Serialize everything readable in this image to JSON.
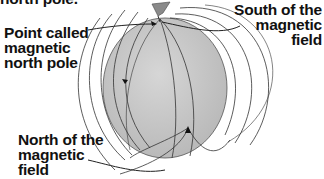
{
  "diagram": {
    "title_fragment": "north pole.",
    "labels": {
      "point_called": "Point called\nmagnetic\nnorth pole",
      "south_field": "South of the\nmagnetic\nfield",
      "north_field": "North of the\nmagnetic\nfield"
    },
    "colors": {
      "globe": "#c4c4c4",
      "flag": "#8a8a8a",
      "lines": "#2a2a2a",
      "text": "#111111"
    }
  }
}
